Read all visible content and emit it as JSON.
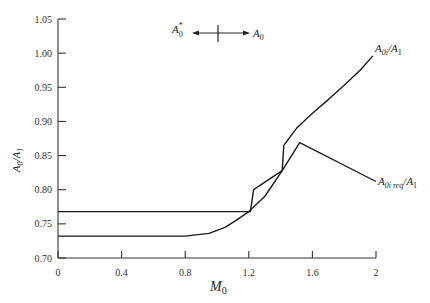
{
  "chart_data": {
    "type": "line",
    "title": "",
    "xlabel": "M_0",
    "ylabel": "A_0/A_1",
    "xlim": [
      0,
      2
    ],
    "ylim": [
      0.7,
      1.05
    ],
    "grid": false,
    "x_ticks": [
      "0",
      "0.4",
      "0.8",
      "1.2",
      "1.6",
      "2"
    ],
    "y_ticks": [
      "0.70",
      "0.75",
      "0.80",
      "0.85",
      "0.90",
      "0.95",
      "1.00",
      "1.05"
    ],
    "series": [
      {
        "name": "A_0i/A_1",
        "points": [
          [
            0,
            0.732
          ],
          [
            0.8,
            0.732
          ],
          [
            0.95,
            0.736
          ],
          [
            1.05,
            0.745
          ],
          [
            1.12,
            0.755
          ],
          [
            1.2,
            0.768
          ],
          [
            1.3,
            0.79
          ],
          [
            1.41,
            0.828
          ],
          [
            1.42,
            0.865
          ],
          [
            1.5,
            0.89
          ],
          [
            1.6,
            0.912
          ],
          [
            1.7,
            0.932
          ],
          [
            1.8,
            0.953
          ],
          [
            1.9,
            0.975
          ],
          [
            1.98,
            0.996
          ]
        ]
      },
      {
        "name": "A_0i req/A_1",
        "points": [
          [
            0,
            0.768
          ],
          [
            1.21,
            0.768
          ],
          [
            1.23,
            0.8
          ],
          [
            1.41,
            0.828
          ],
          [
            1.52,
            0.869
          ],
          [
            2.0,
            0.812
          ]
        ]
      }
    ],
    "annotations": [
      {
        "text": "A*_0 ← | → A_0",
        "position": "top-center"
      },
      {
        "text": "A_0i/A_1",
        "position": "upper-right curve end"
      },
      {
        "text": "A_0i req/A_1",
        "position": "right curve end"
      }
    ]
  },
  "labels": {
    "xlabel_main": "M",
    "xlabel_sub": "0",
    "ylabel": "A0/A1",
    "top_left": "A",
    "top_left_sup": "*",
    "top_left_sub": "0",
    "top_right": "A",
    "top_right_sub": "0",
    "curve1_main": "A",
    "curve1_sub": "0i",
    "curve1_tail": "/A",
    "curve1_tail_sub": "1",
    "curve2_main": "A",
    "curve2_sub": "0i req",
    "curve2_tail": "/A",
    "curve2_tail_sub": "1"
  }
}
